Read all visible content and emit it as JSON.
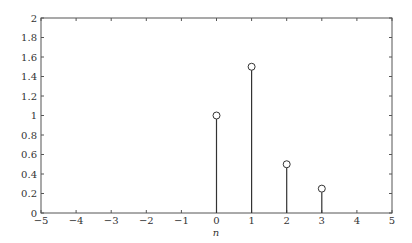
{
  "chart_data": {
    "type": "stem",
    "title": "",
    "xlabel": "n",
    "ylabel": "",
    "xlim": [
      -5,
      5
    ],
    "ylim": [
      0,
      2
    ],
    "xticks": [
      -5,
      -4,
      -3,
      -2,
      -1,
      0,
      1,
      2,
      3,
      4,
      5
    ],
    "xtick_labels": [
      "−5",
      "−4",
      "−3",
      "−2",
      "−1",
      "0",
      "1",
      "2",
      "3",
      "4",
      "5"
    ],
    "yticks": [
      0,
      0.2,
      0.4,
      0.6,
      0.8,
      1,
      1.2,
      1.4,
      1.6,
      1.8,
      2
    ],
    "ytick_labels": [
      "0",
      "0.2",
      "0.4",
      "0.6",
      "0.8",
      "1",
      "1.2",
      "1.4",
      "1.6",
      "1.8",
      "2"
    ],
    "grid": false,
    "x": [
      0,
      1,
      2,
      3
    ],
    "values": [
      1.0,
      1.5,
      0.5,
      0.25
    ],
    "marker": "circle-open",
    "colors": {
      "stem": "#333333",
      "axis": "#555555"
    }
  }
}
